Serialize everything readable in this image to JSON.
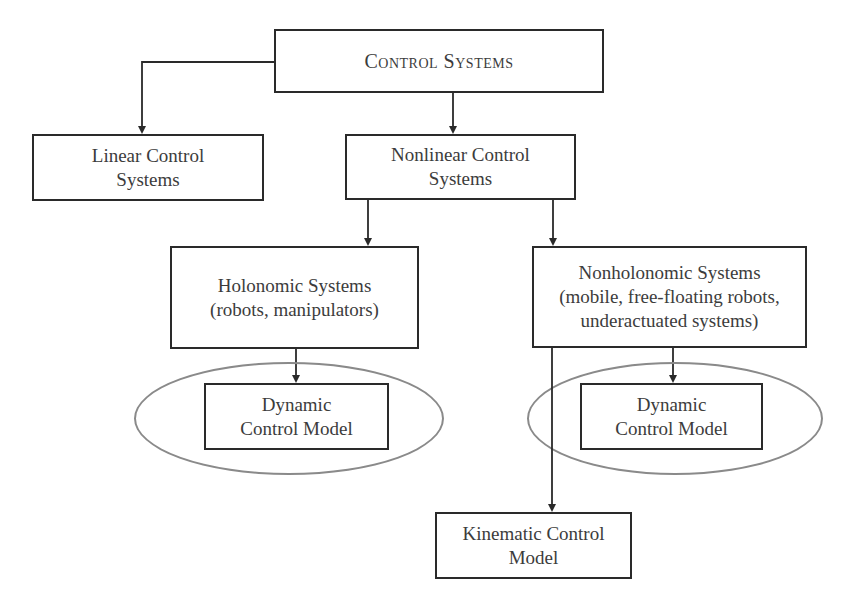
{
  "diagram": {
    "type": "hierarchy-flowchart",
    "nodes": {
      "root": {
        "lines": [
          "Control Systems"
        ]
      },
      "linear": {
        "lines": [
          "Linear Control",
          "Systems"
        ]
      },
      "nonlinear": {
        "lines": [
          "Nonlinear Control",
          "Systems"
        ]
      },
      "holonomic": {
        "lines": [
          "Holonomic Systems",
          "(robots, manipulators)"
        ]
      },
      "nonholonomic": {
        "lines": [
          "Nonholonomic Systems",
          "(mobile, free-floating robots,",
          "underactuated systems)"
        ]
      },
      "dynamic_left": {
        "lines": [
          "Dynamic",
          "Control Model"
        ]
      },
      "dynamic_right": {
        "lines": [
          "Dynamic",
          "Control Model"
        ]
      },
      "kinematic": {
        "lines": [
          "Kinematic Control",
          "Model"
        ]
      }
    },
    "edges": [
      {
        "from": "Control Systems",
        "to": "Linear Control Systems"
      },
      {
        "from": "Control Systems",
        "to": "Nonlinear Control Systems"
      },
      {
        "from": "Nonlinear Control Systems",
        "to": "Holonomic Systems"
      },
      {
        "from": "Nonlinear Control Systems",
        "to": "Nonholonomic Systems"
      },
      {
        "from": "Holonomic Systems",
        "to": "Dynamic Control Model (holonomic)"
      },
      {
        "from": "Nonholonomic Systems",
        "to": "Dynamic Control Model (nonholonomic)"
      },
      {
        "from": "Nonholonomic Systems",
        "to": "Kinematic Control Model"
      }
    ],
    "colors": {
      "box_border": "#2a2a2a",
      "ellipse_border": "#8a8a8a",
      "text": "#3c3c3c",
      "background": "#ffffff"
    }
  }
}
